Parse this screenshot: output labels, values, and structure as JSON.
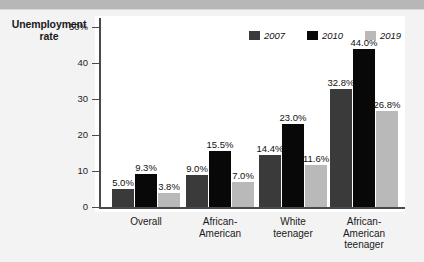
{
  "axis_title": "Unemployment\nrate",
  "axis_title_line1": "Unemployment",
  "axis_title_line2": "rate",
  "colors": {
    "series_2007": "#3a3a3a",
    "series_2010": "#080808",
    "series_2019": "#b9b9b9",
    "background": "#f3f3f3",
    "plot_background": "#ffffff",
    "axis": "#4a4a4a",
    "top_band": "#b7b7b7"
  },
  "legend": {
    "position": "top-right",
    "entries": [
      {
        "label": "2007",
        "color": "#3a3a3a"
      },
      {
        "label": "2010",
        "color": "#080808"
      },
      {
        "label": "2019",
        "color": "#b9b9b9"
      }
    ]
  },
  "y_axis": {
    "ticks": [
      {
        "value": 50,
        "label": "50%"
      },
      {
        "value": 40,
        "label": "40"
      },
      {
        "value": 30,
        "label": "30"
      },
      {
        "value": 20,
        "label": "20"
      },
      {
        "value": 10,
        "label": "10"
      },
      {
        "value": 0,
        "label": "0"
      }
    ],
    "min": 0,
    "max": 52
  },
  "categories": [
    {
      "line1": "Overall",
      "line2": ""
    },
    {
      "line1": "African-",
      "line2": "American"
    },
    {
      "line1": "White",
      "line2": "teenager"
    },
    {
      "line1": "African-",
      "line2": "American",
      "line3": "teenager"
    }
  ],
  "chart_data": {
    "type": "bar",
    "title": "",
    "subtitle": "",
    "xlabel": "",
    "ylabel": "Unemployment rate",
    "ylim": [
      0,
      52
    ],
    "grid": false,
    "legend_position": "top-right",
    "categories": [
      "Overall",
      "African-American",
      "White teenager",
      "African-American teenager"
    ],
    "series": [
      {
        "name": "2007",
        "color": "#3a3a3a",
        "values": [
          5.0,
          9.0,
          14.4,
          32.8
        ],
        "labels": [
          "5.0%",
          "9.0%",
          "14.4%",
          "32.8%"
        ]
      },
      {
        "name": "2010",
        "color": "#080808",
        "values": [
          9.3,
          15.5,
          23.0,
          44.0
        ],
        "labels": [
          "9.3%",
          "15.5%",
          "23.0%",
          "44.0%"
        ]
      },
      {
        "name": "2019",
        "color": "#b9b9b9",
        "values": [
          3.8,
          7.0,
          11.6,
          26.8
        ],
        "labels": [
          "3.8%",
          "7.0%",
          "11.6%",
          "26.8%"
        ]
      }
    ]
  }
}
